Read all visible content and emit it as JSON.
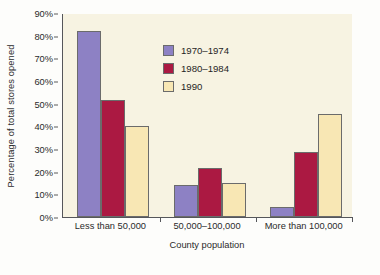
{
  "chart_data": {
    "type": "bar",
    "title": "",
    "xlabel": "County population",
    "ylabel": "Percentage of total stores opened",
    "categories": [
      "Less than 50,000",
      "50,000–100,000",
      "More than 100,000"
    ],
    "series": [
      {
        "name": "1970–1974",
        "color": "#8d81c4",
        "values": [
          82,
          14,
          4.5
        ]
      },
      {
        "name": "1980–1984",
        "color": "#ab1942",
        "values": [
          51.5,
          21.5,
          28.5
        ]
      },
      {
        "name": "1990",
        "color": "#f8e7b4",
        "values": [
          40,
          15,
          45.5
        ]
      }
    ],
    "ylim": [
      0,
      90
    ],
    "ytick_labels": [
      "0%",
      "10%",
      "20%",
      "30%",
      "40%",
      "50%",
      "60%",
      "70%",
      "80%",
      "90%"
    ],
    "ytick_values": [
      0,
      10,
      20,
      30,
      40,
      50,
      60,
      70,
      80,
      90
    ],
    "grid": false,
    "legend_position": "upper-center",
    "plot_background": "#f7f3e2",
    "figure_background": "#fdfdfb",
    "axis_color": "#55565a",
    "bar_edge_color": "#6b6b6b"
  }
}
